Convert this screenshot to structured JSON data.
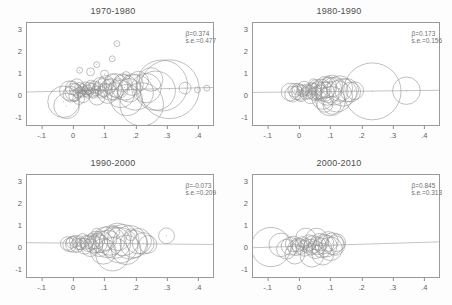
{
  "figure": {
    "layout": "2x2 panel grid",
    "panel_count": 4
  },
  "chart_data": [
    {
      "type": "scatter",
      "title": "1970-1980",
      "xlabel": "",
      "ylabel": "",
      "xlim": [
        -0.15,
        0.45
      ],
      "ylim": [
        -1.4,
        3.3
      ],
      "xticks": [
        -0.1,
        0,
        0.1,
        0.2,
        0.3,
        0.4
      ],
      "xticklabels": [
        "-.1",
        "0",
        ".1",
        ".2",
        ".3",
        ".4"
      ],
      "yticks": [
        -1,
        0,
        1,
        2,
        3
      ],
      "yticklabels": [
        "-1",
        "0",
        "1",
        "2",
        "3"
      ],
      "grid": false,
      "legend": "none",
      "marker": "open-circle-weighted",
      "annotations": [
        "β=0.374",
        "s.e.=0.477"
      ],
      "beta": 0.374,
      "se": 0.477,
      "fit_line": {
        "x": [
          -0.15,
          0.45
        ],
        "y": [
          0.12,
          0.33
        ]
      },
      "points": [
        {
          "x": -0.032,
          "y": -0.33,
          "s": 16
        },
        {
          "x": -0.022,
          "y": -0.52,
          "s": 13
        },
        {
          "x": -0.013,
          "y": 0.18,
          "s": 10
        },
        {
          "x": -0.008,
          "y": 0.02,
          "s": 8
        },
        {
          "x": -0.004,
          "y": 0.31,
          "s": 7
        },
        {
          "x": 0.001,
          "y": 0.12,
          "s": 9
        },
        {
          "x": 0.004,
          "y": -0.05,
          "s": 6
        },
        {
          "x": 0.007,
          "y": 0.24,
          "s": 6
        },
        {
          "x": 0.011,
          "y": 0.41,
          "s": 7
        },
        {
          "x": 0.014,
          "y": 0.08,
          "s": 5
        },
        {
          "x": 0.017,
          "y": -0.18,
          "s": 6
        },
        {
          "x": 0.02,
          "y": 0.33,
          "s": 5
        },
        {
          "x": 0.023,
          "y": 0.15,
          "s": 5
        },
        {
          "x": 0.026,
          "y": 0.05,
          "s": 4
        },
        {
          "x": 0.029,
          "y": 0.27,
          "s": 5
        },
        {
          "x": 0.032,
          "y": -0.1,
          "s": 6
        },
        {
          "x": 0.035,
          "y": 0.19,
          "s": 4
        },
        {
          "x": 0.038,
          "y": 0.36,
          "s": 5
        },
        {
          "x": 0.041,
          "y": 0.09,
          "s": 4
        },
        {
          "x": 0.044,
          "y": 0.22,
          "s": 5
        },
        {
          "x": 0.047,
          "y": 0.01,
          "s": 4
        },
        {
          "x": 0.05,
          "y": 0.3,
          "s": 6
        },
        {
          "x": 0.053,
          "y": 0.14,
          "s": 4
        },
        {
          "x": 0.056,
          "y": 0.44,
          "s": 5
        },
        {
          "x": 0.06,
          "y": 0.2,
          "s": 7
        },
        {
          "x": 0.064,
          "y": 0.06,
          "s": 5
        },
        {
          "x": 0.068,
          "y": 0.35,
          "s": 6
        },
        {
          "x": 0.072,
          "y": 0.17,
          "s": 5
        },
        {
          "x": 0.076,
          "y": -0.12,
          "s": 8
        },
        {
          "x": 0.08,
          "y": 0.28,
          "s": 6
        },
        {
          "x": 0.085,
          "y": 0.47,
          "s": 7
        },
        {
          "x": 0.09,
          "y": 0.11,
          "s": 6
        },
        {
          "x": 0.095,
          "y": 0.33,
          "s": 9
        },
        {
          "x": 0.1,
          "y": 0.2,
          "s": 7
        },
        {
          "x": 0.105,
          "y": 0.52,
          "s": 8
        },
        {
          "x": 0.11,
          "y": 0.05,
          "s": 10
        },
        {
          "x": 0.115,
          "y": 0.38,
          "s": 7
        },
        {
          "x": 0.12,
          "y": 0.24,
          "s": 11
        },
        {
          "x": 0.126,
          "y": 0.6,
          "s": 8
        },
        {
          "x": 0.132,
          "y": 0.15,
          "s": 9
        },
        {
          "x": 0.138,
          "y": 0.42,
          "s": 12
        },
        {
          "x": 0.145,
          "y": 0.28,
          "s": 10
        },
        {
          "x": 0.152,
          "y": 0.03,
          "s": 14
        },
        {
          "x": 0.158,
          "y": 0.55,
          "s": 9
        },
        {
          "x": 0.165,
          "y": 0.33,
          "s": 13
        },
        {
          "x": 0.172,
          "y": -0.25,
          "s": 16
        },
        {
          "x": 0.18,
          "y": 0.2,
          "s": 12
        },
        {
          "x": 0.19,
          "y": 0.46,
          "s": 11
        },
        {
          "x": 0.2,
          "y": 0.1,
          "s": 18
        },
        {
          "x": 0.21,
          "y": 0.62,
          "s": 10
        },
        {
          "x": 0.22,
          "y": -0.45,
          "s": 22
        },
        {
          "x": 0.235,
          "y": 0.3,
          "s": 15
        },
        {
          "x": 0.25,
          "y": 0.7,
          "s": 12
        },
        {
          "x": 0.265,
          "y": 0.18,
          "s": 20
        },
        {
          "x": 0.285,
          "y": 0.42,
          "s": 26
        },
        {
          "x": 0.31,
          "y": 0.25,
          "s": 30
        },
        {
          "x": 0.055,
          "y": 1.05,
          "s": 4
        },
        {
          "x": 0.075,
          "y": 1.38,
          "s": 3
        },
        {
          "x": 0.02,
          "y": 1.12,
          "s": 3
        },
        {
          "x": 0.1,
          "y": 0.95,
          "s": 4
        },
        {
          "x": 0.125,
          "y": 1.65,
          "s": 3
        },
        {
          "x": 0.14,
          "y": 2.35,
          "s": 3
        },
        {
          "x": 0.17,
          "y": 0.88,
          "s": 4
        },
        {
          "x": 0.36,
          "y": 0.3,
          "s": 6
        },
        {
          "x": 0.4,
          "y": 0.22,
          "s": 3
        },
        {
          "x": 0.43,
          "y": 0.3,
          "s": 3
        }
      ]
    },
    {
      "type": "scatter",
      "title": "1980-1990",
      "xlabel": "",
      "ylabel": "",
      "xlim": [
        -0.15,
        0.45
      ],
      "ylim": [
        -1.4,
        3.3
      ],
      "xticks": [
        -0.1,
        0,
        0.1,
        0.2,
        0.3,
        0.4
      ],
      "xticklabels": [
        "-.1",
        "0",
        ".1",
        ".2",
        ".3",
        ".4"
      ],
      "yticks": [
        -1,
        0,
        1,
        2,
        3
      ],
      "yticklabels": [
        "-1",
        "0",
        "1",
        "2",
        "3"
      ],
      "grid": false,
      "legend": "none",
      "marker": "open-circle-weighted",
      "annotations": [
        "β=0.173",
        "s.e.=0.156"
      ],
      "beta": 0.173,
      "se": 0.156,
      "fit_line": {
        "x": [
          -0.15,
          0.45
        ],
        "y": [
          0.1,
          0.2
        ]
      },
      "points": [
        {
          "x": -0.03,
          "y": 0.12,
          "s": 9
        },
        {
          "x": -0.022,
          "y": 0.02,
          "s": 8
        },
        {
          "x": -0.015,
          "y": 0.2,
          "s": 7
        },
        {
          "x": -0.01,
          "y": 0.08,
          "s": 7
        },
        {
          "x": -0.005,
          "y": 0.25,
          "s": 6
        },
        {
          "x": 0,
          "y": 0.1,
          "s": 8
        },
        {
          "x": 0.005,
          "y": -0.05,
          "s": 6
        },
        {
          "x": 0.01,
          "y": 0.18,
          "s": 6
        },
        {
          "x": 0.015,
          "y": 0.3,
          "s": 7
        },
        {
          "x": 0.02,
          "y": 0.05,
          "s": 6
        },
        {
          "x": 0.025,
          "y": 0.22,
          "s": 6
        },
        {
          "x": 0.03,
          "y": 0.12,
          "s": 7
        },
        {
          "x": 0.035,
          "y": -0.1,
          "s": 7
        },
        {
          "x": 0.04,
          "y": 0.28,
          "s": 6
        },
        {
          "x": 0.045,
          "y": 0.15,
          "s": 8
        },
        {
          "x": 0.05,
          "y": 0.04,
          "s": 7
        },
        {
          "x": 0.055,
          "y": 0.33,
          "s": 8
        },
        {
          "x": 0.06,
          "y": 0.19,
          "s": 9
        },
        {
          "x": 0.065,
          "y": 0.08,
          "s": 8
        },
        {
          "x": 0.07,
          "y": 0.26,
          "s": 10
        },
        {
          "x": 0.075,
          "y": -0.18,
          "s": 11
        },
        {
          "x": 0.08,
          "y": 0.14,
          "s": 10
        },
        {
          "x": 0.085,
          "y": 0.35,
          "s": 11
        },
        {
          "x": 0.09,
          "y": 0.05,
          "s": 12
        },
        {
          "x": 0.095,
          "y": 0.22,
          "s": 13
        },
        {
          "x": 0.1,
          "y": -0.3,
          "s": 15
        },
        {
          "x": 0.105,
          "y": 0.4,
          "s": 11
        },
        {
          "x": 0.112,
          "y": 0.16,
          "s": 14
        },
        {
          "x": 0.12,
          "y": -0.08,
          "s": 16
        },
        {
          "x": 0.13,
          "y": 0.28,
          "s": 13
        },
        {
          "x": 0.14,
          "y": 0.1,
          "s": 14
        },
        {
          "x": 0.152,
          "y": 0.2,
          "s": 12
        },
        {
          "x": 0.165,
          "y": 0.12,
          "s": 10
        },
        {
          "x": 0.178,
          "y": 0.18,
          "s": 9
        },
        {
          "x": 0.235,
          "y": 0.15,
          "s": 29
        },
        {
          "x": 0.345,
          "y": 0.18,
          "s": 14
        },
        {
          "x": 0.045,
          "y": 0.5,
          "s": 5
        },
        {
          "x": 0.09,
          "y": 0.55,
          "s": 5
        },
        {
          "x": 0.105,
          "y": -0.5,
          "s": 9
        },
        {
          "x": 0.082,
          "y": -0.45,
          "s": 8
        }
      ]
    },
    {
      "type": "scatter",
      "title": "1990-2000",
      "xlabel": "",
      "ylabel": "",
      "xlim": [
        -0.15,
        0.45
      ],
      "ylim": [
        -1.4,
        3.3
      ],
      "xticks": [
        -0.1,
        0,
        0.1,
        0.2,
        0.3,
        0.4
      ],
      "xticklabels": [
        "-.1",
        "0",
        ".1",
        ".2",
        ".3",
        ".4"
      ],
      "yticks": [
        -1,
        0,
        1,
        2,
        3
      ],
      "yticklabels": [
        "-1",
        "0",
        "1",
        "2",
        "3"
      ],
      "grid": false,
      "legend": "none",
      "marker": "open-circle-weighted",
      "annotations": [
        "β=-0.073",
        "s.e.=0.209"
      ],
      "beta": -0.073,
      "se": 0.209,
      "fit_line": {
        "x": [
          -0.15,
          0.45
        ],
        "y": [
          0.18,
          0.1
        ]
      },
      "points": [
        {
          "x": -0.02,
          "y": 0.14,
          "s": 7
        },
        {
          "x": -0.012,
          "y": 0.08,
          "s": 7
        },
        {
          "x": -0.005,
          "y": 0.2,
          "s": 6
        },
        {
          "x": 0,
          "y": 0.1,
          "s": 8
        },
        {
          "x": 0.006,
          "y": 0.25,
          "s": 6
        },
        {
          "x": 0.012,
          "y": 0.05,
          "s": 7
        },
        {
          "x": 0.018,
          "y": 0.18,
          "s": 7
        },
        {
          "x": 0.024,
          "y": 0.12,
          "s": 6
        },
        {
          "x": 0.03,
          "y": 0.28,
          "s": 7
        },
        {
          "x": 0.036,
          "y": 0.02,
          "s": 8
        },
        {
          "x": 0.042,
          "y": 0.2,
          "s": 7
        },
        {
          "x": 0.048,
          "y": 0.14,
          "s": 8
        },
        {
          "x": 0.054,
          "y": -0.05,
          "s": 9
        },
        {
          "x": 0.06,
          "y": 0.24,
          "s": 8
        },
        {
          "x": 0.066,
          "y": 0.1,
          "s": 9
        },
        {
          "x": 0.072,
          "y": 0.3,
          "s": 9
        },
        {
          "x": 0.078,
          "y": 0.16,
          "s": 10
        },
        {
          "x": 0.084,
          "y": 0.04,
          "s": 11
        },
        {
          "x": 0.09,
          "y": 0.22,
          "s": 11
        },
        {
          "x": 0.096,
          "y": -0.22,
          "s": 13
        },
        {
          "x": 0.102,
          "y": 0.36,
          "s": 12
        },
        {
          "x": 0.11,
          "y": 0.12,
          "s": 14
        },
        {
          "x": 0.118,
          "y": 0.28,
          "s": 15
        },
        {
          "x": 0.126,
          "y": -0.35,
          "s": 17
        },
        {
          "x": 0.134,
          "y": 0.18,
          "s": 16
        },
        {
          "x": 0.142,
          "y": 0.45,
          "s": 14
        },
        {
          "x": 0.15,
          "y": 0.06,
          "s": 18
        },
        {
          "x": 0.16,
          "y": 0.3,
          "s": 16
        },
        {
          "x": 0.17,
          "y": -0.15,
          "s": 15
        },
        {
          "x": 0.182,
          "y": 0.2,
          "s": 17
        },
        {
          "x": 0.195,
          "y": 0.12,
          "s": 14
        },
        {
          "x": 0.21,
          "y": 0.25,
          "s": 13
        },
        {
          "x": 0.225,
          "y": 0.15,
          "s": 11
        },
        {
          "x": 0.24,
          "y": 0.1,
          "s": 9
        },
        {
          "x": 0.3,
          "y": 0.5,
          "s": 8
        },
        {
          "x": 0.075,
          "y": 0.62,
          "s": 5
        },
        {
          "x": 0.13,
          "y": 0.7,
          "s": 6
        },
        {
          "x": 0.185,
          "y": 0.55,
          "s": 6
        }
      ]
    },
    {
      "type": "scatter",
      "title": "2000-2010",
      "xlabel": "",
      "ylabel": "",
      "xlim": [
        -0.15,
        0.45
      ],
      "ylim": [
        -1.4,
        3.3
      ],
      "xticks": [
        -0.1,
        0,
        0.1,
        0.2,
        0.3,
        0.4
      ],
      "xticklabels": [
        "-.1",
        "0",
        ".1",
        ".2",
        ".3",
        ".4"
      ],
      "yticks": [
        -1,
        0,
        1,
        2,
        3
      ],
      "yticklabels": [
        "-1",
        "0",
        "1",
        "2",
        "3"
      ],
      "grid": false,
      "legend": "none",
      "marker": "open-circle-weighted",
      "annotations": [
        "β=0.845",
        "s.e.=0.313"
      ],
      "beta": 0.845,
      "se": 0.313,
      "fit_line": {
        "x": [
          -0.15,
          0.45
        ],
        "y": [
          -0.05,
          0.22
        ]
      },
      "points": [
        {
          "x": -0.092,
          "y": -0.02,
          "s": 20
        },
        {
          "x": -0.06,
          "y": 0.08,
          "s": 12
        },
        {
          "x": -0.042,
          "y": -0.12,
          "s": 10
        },
        {
          "x": -0.03,
          "y": 0.02,
          "s": 9
        },
        {
          "x": -0.02,
          "y": 0.12,
          "s": 8
        },
        {
          "x": -0.012,
          "y": -0.05,
          "s": 8
        },
        {
          "x": -0.005,
          "y": 0.08,
          "s": 7
        },
        {
          "x": 0.002,
          "y": 0.0,
          "s": 8
        },
        {
          "x": 0.009,
          "y": 0.14,
          "s": 7
        },
        {
          "x": 0.016,
          "y": -0.08,
          "s": 8
        },
        {
          "x": 0.023,
          "y": 0.05,
          "s": 7
        },
        {
          "x": 0.03,
          "y": 0.18,
          "s": 8
        },
        {
          "x": 0.037,
          "y": -0.02,
          "s": 8
        },
        {
          "x": 0.044,
          "y": 0.1,
          "s": 9
        },
        {
          "x": 0.051,
          "y": -0.14,
          "s": 9
        },
        {
          "x": 0.058,
          "y": 0.04,
          "s": 9
        },
        {
          "x": 0.065,
          "y": 0.2,
          "s": 9
        },
        {
          "x": 0.072,
          "y": -0.06,
          "s": 10
        },
        {
          "x": 0.079,
          "y": 0.12,
          "s": 10
        },
        {
          "x": 0.086,
          "y": 0.02,
          "s": 11
        },
        {
          "x": 0.093,
          "y": 0.24,
          "s": 10
        },
        {
          "x": 0.1,
          "y": -0.1,
          "s": 12
        },
        {
          "x": 0.107,
          "y": 0.14,
          "s": 11
        },
        {
          "x": 0.114,
          "y": 0.05,
          "s": 10
        },
        {
          "x": 0.12,
          "y": 0.18,
          "s": 9
        },
        {
          "x": 0.055,
          "y": 0.35,
          "s": 11
        },
        {
          "x": 0.02,
          "y": 0.4,
          "s": 10
        },
        {
          "x": 0.04,
          "y": -0.4,
          "s": 12
        },
        {
          "x": 0.075,
          "y": -0.35,
          "s": 11
        },
        {
          "x": -0.015,
          "y": -0.35,
          "s": 10
        }
      ]
    }
  ]
}
